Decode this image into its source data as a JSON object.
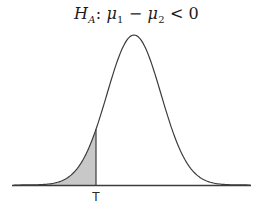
{
  "title": {
    "h": "H",
    "h_sub": "A",
    "colon": ":",
    "mu1": "μ",
    "mu1_sub": "1",
    "minus": "−",
    "mu2": "μ",
    "mu2_sub": "2",
    "lt": "<",
    "zero": "0"
  },
  "axis": {
    "t_label": "T"
  },
  "chart_data": {
    "type": "area",
    "xlabel": "",
    "ylabel": "",
    "x_tick_labels": [
      "T"
    ],
    "shaded_region": {
      "area": "left-tail",
      "boundary_label": "T"
    },
    "legend": "none",
    "grid": "off",
    "colors": {
      "curve_stroke": "#3c3c3c",
      "shade_fill": "#c8c8c8",
      "axis_stroke": "#3c3c3c",
      "text": "#2a2a2a",
      "background": "#ffffff"
    },
    "geometry": {
      "peak_x": 134,
      "peak_y": 35,
      "baseline_y": 185,
      "sigma": 27,
      "axis_x0": 12,
      "axis_x1": 251,
      "curve_x0": 14,
      "curve_x1": 250,
      "shade_x0": 16,
      "t_x": 96,
      "t_label_y": 201
    }
  }
}
